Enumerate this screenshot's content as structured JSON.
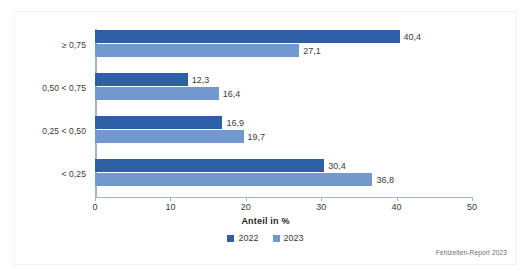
{
  "chart_data": {
    "type": "bar",
    "orientation": "horizontal",
    "title": "",
    "xlabel": "Anteil in %",
    "ylabel": "",
    "xlim": [
      0,
      50
    ],
    "xticks": [
      0,
      10,
      20,
      30,
      40,
      50
    ],
    "xtick_labels": [
      "0",
      "10",
      "20",
      "30",
      "40",
      "50"
    ],
    "grid": false,
    "legend_position": "bottom-center",
    "categories": [
      "≥ 0,75",
      "0,50 < 0,75",
      "0,25 < 0,50",
      "< 0,25"
    ],
    "series": [
      {
        "name": "2022",
        "color": "#2d5ea6",
        "values": [
          40.4,
          12.3,
          16.9,
          30.4
        ],
        "value_labels": [
          "40,4",
          "12,3",
          "16,9",
          "30,4"
        ]
      },
      {
        "name": "2023",
        "color": "#7199ce",
        "values": [
          27.1,
          16.4,
          19.7,
          36.8
        ],
        "value_labels": [
          "27,1",
          "16,4",
          "19,7",
          "36,8"
        ]
      }
    ],
    "source": "Fehlzeiten-Report 2023"
  },
  "colors": {
    "series_2022": "#2d5ea6",
    "series_2023": "#7199ce",
    "axis": "#9fb6d4",
    "text": "#3b3b3b",
    "background": "#ffffff"
  }
}
